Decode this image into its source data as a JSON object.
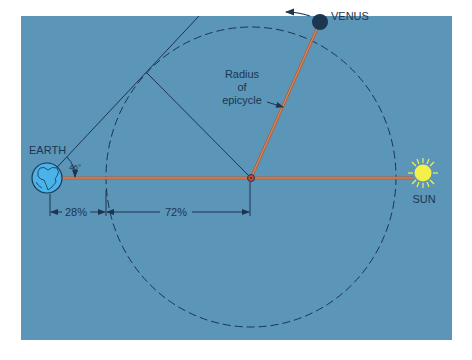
{
  "colors": {
    "background": "#5b95b8",
    "page": "#ffffff",
    "line": "#1c3550",
    "radius_line": "#b4603a",
    "earth_fill": "#4ab3ea",
    "sun_fill": "#f4f04a",
    "venus_fill": "#1c3550",
    "center_dot": "#d2452c"
  },
  "labels": {
    "earth": "EARTH",
    "venus": "VENUS",
    "sun": "SUN",
    "radius_line1": "Radius",
    "radius_line2": "of",
    "radius_line3": "epicycle",
    "angle": "46°",
    "dist_earth_to_epicycle": "28%",
    "dist_epicycle_to_center": "72%"
  }
}
